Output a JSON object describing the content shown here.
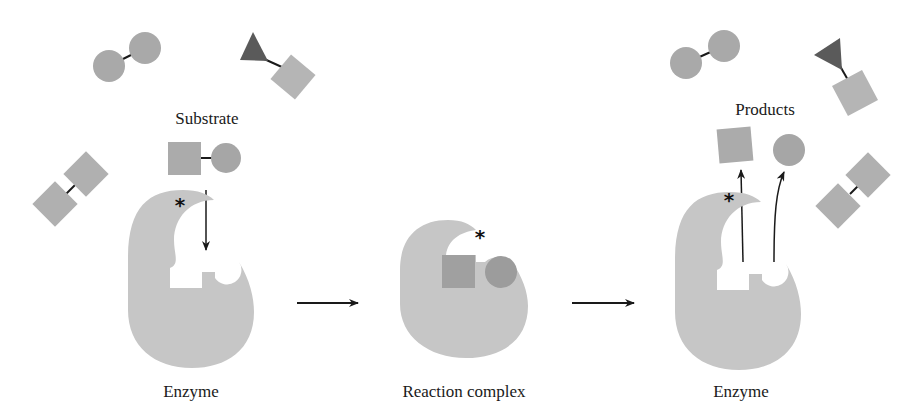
{
  "diagram": {
    "labels": {
      "substrate": "Substrate",
      "products": "Products",
      "enzyme_left": "Enzyme",
      "reaction_complex": "Reaction complex",
      "enzyme_right": "Enzyme"
    },
    "active_site_marker": "*",
    "stages": [
      "Enzyme + Substrate",
      "Reaction complex",
      "Enzyme + Products"
    ],
    "colors": {
      "enzyme": "#c6c6c6",
      "molecule": "#a9a9a9",
      "molecule_light": "#b5b5b5",
      "triangle": "#5a5a5a",
      "bound_square": "#a0a0a0",
      "bound_circle": "#9c9c9c",
      "ink": "#1a1a1a"
    }
  }
}
